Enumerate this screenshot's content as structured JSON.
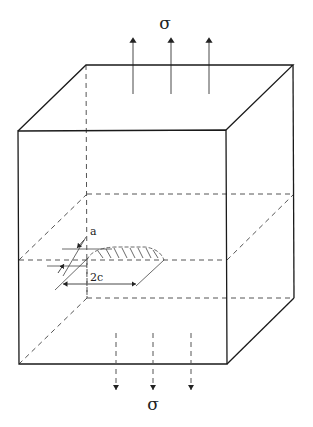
{
  "diagram": {
    "labels": {
      "stress_top": "σ",
      "stress_bottom": "σ",
      "crack_depth": "a",
      "crack_length": "2c"
    },
    "elements": [
      {
        "id": "block",
        "type": "3D box (cube)",
        "front_face": "solid",
        "hidden_edges": "dashed"
      },
      {
        "id": "tension-arrows-top",
        "type": "3 upward arrows",
        "label": "σ"
      },
      {
        "id": "tension-arrows-bottom",
        "type": "3 downward dashed arrows",
        "label": "σ"
      },
      {
        "id": "mid-plane",
        "type": "dashed horizontal section plane"
      },
      {
        "id": "crack",
        "type": "semi-elliptical hatched surface crack",
        "dimensions": [
          "a",
          "2c"
        ]
      }
    ],
    "colors": {
      "line": "#1a1a1a",
      "dashed": "#555555",
      "background": "#ffffff"
    }
  }
}
